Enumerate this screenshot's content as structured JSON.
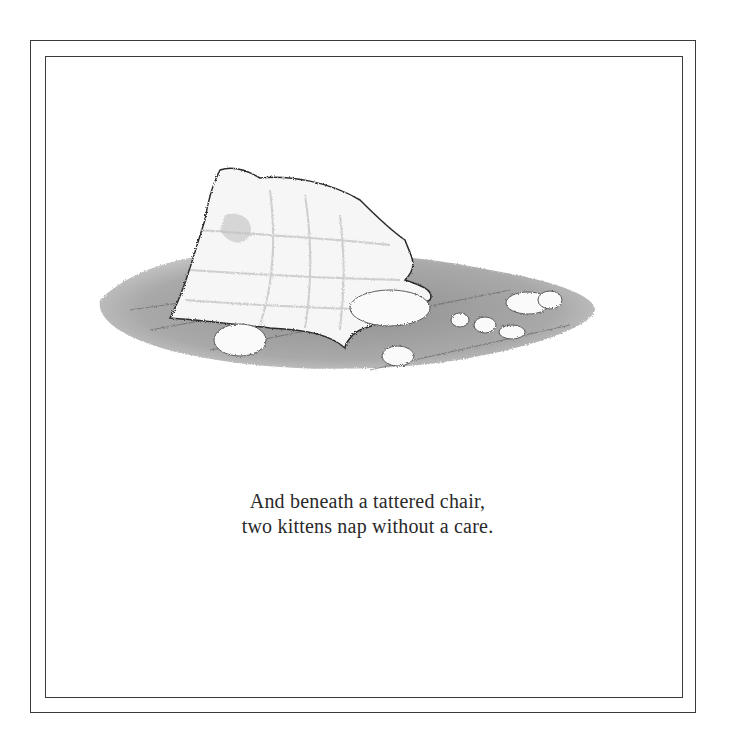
{
  "page": {
    "verse": {
      "lines": [
        "And beneath a tattered chair,",
        "two kittens nap without a care."
      ]
    },
    "illustration": {
      "subject": "tattered pillow with scattered stuffing on wooden floor"
    },
    "colors": {
      "border": "#3a3a3a",
      "text": "#2a2a2a",
      "floor": "#8a8a8a",
      "background": "#ffffff"
    }
  }
}
